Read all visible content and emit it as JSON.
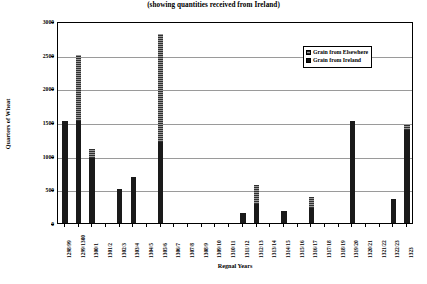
{
  "chart_data": {
    "type": "bar",
    "title": "(showing quantities received from Ireland)",
    "xlabel": "Regnal Years",
    "ylabel": "Quarters of Wheat",
    "ylim": [
      0,
      3000
    ],
    "ytick_step": 500,
    "yticks": [
      "0",
      "500",
      "1000",
      "1500",
      "2000",
      "2500",
      "3000"
    ],
    "grid": true,
    "stacked": true,
    "legend_position": "top-right",
    "categories": [
      "1298/99",
      "1299/1300",
      "1300/1",
      "1301/2",
      "1302/3",
      "1303/4",
      "1304/5",
      "1305/6",
      "1306/7",
      "1307/8",
      "1308/9",
      "1309/10",
      "1310/11",
      "1311/12",
      "1312/13",
      "1313/14",
      "1314/15",
      "1315/16",
      "1316/17",
      "1317/18",
      "1318/19",
      "1319/20",
      "1320/21",
      "1321/22",
      "1322/23",
      "1323"
    ],
    "series": [
      {
        "name": "Grain from Ireland",
        "color": "#1a1a1a",
        "values": [
          1510,
          1510,
          960,
          0,
          500,
          680,
          0,
          1200,
          0,
          0,
          0,
          0,
          0,
          150,
          280,
          0,
          180,
          0,
          230,
          0,
          0,
          1510,
          0,
          0,
          350,
          1380
        ]
      },
      {
        "name": "Grain from Elsewhere",
        "color": "#6b6b6b",
        "values": [
          0,
          990,
          140,
          0,
          0,
          0,
          0,
          1600,
          0,
          0,
          0,
          0,
          0,
          0,
          280,
          0,
          0,
          0,
          150,
          0,
          0,
          0,
          0,
          0,
          0,
          80
        ]
      }
    ]
  },
  "legend": {
    "items": [
      {
        "label": "Grain from Elsewhere",
        "swatch": "hatched-gray-swatch"
      },
      {
        "label": "Grain from Ireland",
        "swatch": "solid-black-swatch"
      }
    ]
  }
}
